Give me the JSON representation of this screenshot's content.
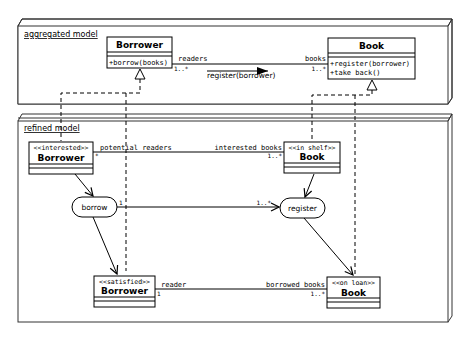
{
  "packages": {
    "aggregated": {
      "label": "aggregated model"
    },
    "refined": {
      "label": "refined model"
    }
  },
  "aggregated_model": {
    "borrower": {
      "name": "Borrower",
      "operations": [
        "+borrow(books)"
      ]
    },
    "book": {
      "name": "Book",
      "operations": [
        "+register(borrower)",
        "+take back()"
      ]
    },
    "association": {
      "borrower_role": "readers",
      "borrower_multiplicity": "1..*",
      "book_role": "books",
      "book_multiplicity": "1..*",
      "message": "register(borrower)"
    }
  },
  "refined_model": {
    "interested_borrower": {
      "stereotype": "<<interested>>",
      "name": "Borrower"
    },
    "in_shelf_book": {
      "stereotype": "<<in shelf>>",
      "name": "Book"
    },
    "satisfied_borrower": {
      "stereotype": "<<satisfied>>",
      "name": "Borrower"
    },
    "on_loan_book": {
      "stereotype": "<<on loan>>",
      "name": "Book"
    },
    "top_association": {
      "left_role": "potential readers",
      "left_multiplicity": "*",
      "right_role": "interested books",
      "right_multiplicity": "1..*"
    },
    "bottom_association": {
      "left_role": "reader",
      "left_multiplicity": "1",
      "right_role": "borrowed books",
      "right_multiplicity": "1..*"
    },
    "actions": {
      "borrow": "borrow",
      "register": "register"
    },
    "action_link": {
      "source_multiplicity": "1",
      "target_multiplicity": "1..*"
    }
  },
  "colors": {
    "line": "#000000",
    "frame_fill": "#ffffff",
    "frame_stroke": "#333333"
  }
}
